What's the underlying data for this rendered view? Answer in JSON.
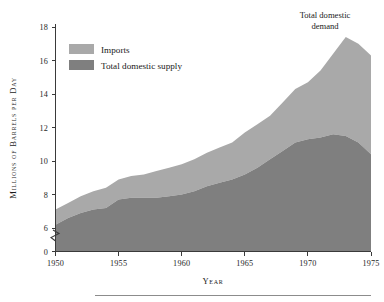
{
  "chart_data": {
    "type": "area",
    "title": "",
    "subtitle": "",
    "xlabel": "Year",
    "ylabel": "Millions of Barrels per Day",
    "stacked": true,
    "grid": false,
    "legend_position": "inside-top-left",
    "xlim": [
      1950,
      1975
    ],
    "ylim": [
      0,
      18
    ],
    "y_axis_break": {
      "present": true,
      "between": [
        0,
        6
      ],
      "symbol": "zigzag"
    },
    "x_ticks": [
      1950,
      1955,
      1960,
      1965,
      1970,
      1975
    ],
    "x_tick_labels": [
      "1950",
      "1955",
      "1960",
      "1965",
      "1970",
      "1975"
    ],
    "y_ticks": [
      0,
      6,
      8,
      10,
      12,
      14,
      16,
      18
    ],
    "y_tick_labels": [
      "0",
      "6",
      "8",
      "10",
      "12",
      "14",
      "16",
      "18"
    ],
    "x": [
      1950,
      1951,
      1952,
      1953,
      1954,
      1955,
      1956,
      1957,
      1958,
      1959,
      1960,
      1961,
      1962,
      1963,
      1964,
      1965,
      1966,
      1967,
      1968,
      1969,
      1970,
      1971,
      1972,
      1973,
      1974,
      1975
    ],
    "series": [
      {
        "name": "Total domestic supply",
        "color": "#7f7f7f",
        "values": [
          6.2,
          6.6,
          6.9,
          7.1,
          7.2,
          7.7,
          7.8,
          7.8,
          7.8,
          7.9,
          8.0,
          8.2,
          8.5,
          8.7,
          8.9,
          9.2,
          9.6,
          10.1,
          10.6,
          11.1,
          11.3,
          11.4,
          11.6,
          11.5,
          11.1,
          10.4
        ]
      },
      {
        "name": "Imports",
        "color": "#a9a9a9",
        "values": [
          0.9,
          0.9,
          1.0,
          1.1,
          1.2,
          1.2,
          1.3,
          1.4,
          1.6,
          1.7,
          1.8,
          1.9,
          2.0,
          2.1,
          2.2,
          2.5,
          2.6,
          2.6,
          2.9,
          3.2,
          3.4,
          4.0,
          4.8,
          5.9,
          5.9,
          5.9
        ]
      }
    ],
    "total_label": "Total domestic demand",
    "totals": [
      7.1,
      7.5,
      7.9,
      8.2,
      8.4,
      8.9,
      9.1,
      9.2,
      9.4,
      9.6,
      9.8,
      10.1,
      10.5,
      10.8,
      11.1,
      11.7,
      12.2,
      12.7,
      13.5,
      14.3,
      14.7,
      15.4,
      16.4,
      17.4,
      17.0,
      16.3
    ]
  },
  "legend": {
    "items": [
      {
        "label": "Imports",
        "color": "#a9a9a9"
      },
      {
        "label": "Total domestic supply",
        "color": "#7f7f7f"
      }
    ]
  },
  "annotation": {
    "line1": "Total domestic",
    "line2": "demand"
  },
  "axis_titles": {
    "x": "Year",
    "y": "Millions of Barrels per Day"
  },
  "ticks": {
    "y": [
      "18",
      "16",
      "14",
      "12",
      "10",
      "8",
      "6",
      "0"
    ],
    "x": [
      "1950",
      "1955",
      "1960",
      "1965",
      "1970",
      "1975"
    ]
  }
}
